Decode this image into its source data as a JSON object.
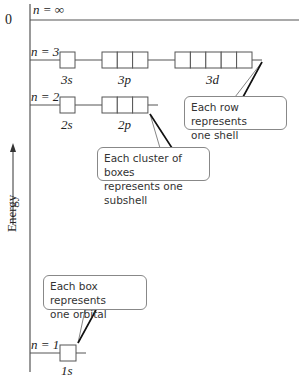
{
  "diagram": {
    "axis": {
      "zero_label": "0",
      "energy_label": "Energy",
      "arrow": "up"
    },
    "levels": [
      {
        "n_label": "n = ∞",
        "y": 18
      },
      {
        "n_label": "n = 3",
        "y": 60,
        "subshells": [
          {
            "label": "3s",
            "boxes": 1
          },
          {
            "label": "3p",
            "boxes": 3
          },
          {
            "label": "3d",
            "boxes": 5
          }
        ]
      },
      {
        "n_label": "n = 2",
        "y": 105,
        "subshells": [
          {
            "label": "2s",
            "boxes": 1
          },
          {
            "label": "2p",
            "boxes": 3
          }
        ]
      },
      {
        "n_label": "n = 1",
        "y": 353,
        "subshells": [
          {
            "label": "1s",
            "boxes": 1
          }
        ]
      }
    ],
    "callouts": {
      "shell": {
        "line1": "Each row represents",
        "line2": "one shell"
      },
      "subshell": {
        "line1": "Each cluster of boxes",
        "line2": "represents one subshell"
      },
      "orbital": {
        "line1": "Each box represents",
        "line2": "one orbital"
      }
    },
    "colors": {
      "lines": "#555555",
      "text": "#222222",
      "callout_border": "#888888"
    }
  }
}
